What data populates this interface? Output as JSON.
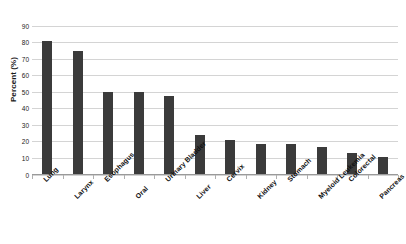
{
  "chart_data": {
    "type": "bar",
    "title": "in Adults",
    "title_note": "first title line is cropped off the top of the screenshot; only \"in Adults\" is visible",
    "xlabel": "",
    "ylabel": "Percent (%)",
    "ylim": [
      0,
      90
    ],
    "ytick_step": 10,
    "yticks": [
      "90",
      "80",
      "70",
      "60",
      "50",
      "40",
      "30",
      "20",
      "10",
      "0"
    ],
    "grid": true,
    "legend": false,
    "bar_color": "#3b3b3b",
    "gridline_color": "#d4d4d4",
    "categories": [
      "Lung",
      "Larynx",
      "Esophagus",
      "Oral",
      "Urinary Bladder",
      "Liver",
      "Cervix",
      "Kidney",
      "Stomach",
      "Myeloid Leukemia",
      "Colorectal",
      "Pancreas"
    ],
    "values": [
      81,
      75,
      50,
      50,
      48,
      24,
      21,
      19,
      19,
      17,
      13,
      11
    ]
  }
}
